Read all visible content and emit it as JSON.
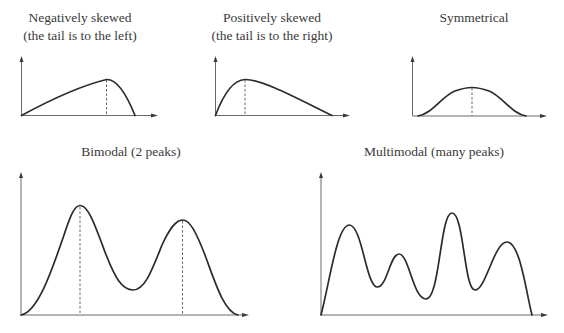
{
  "figure": {
    "panels": [
      {
        "id": "negatively-skewed",
        "title_lines": [
          "Negatively skewed",
          "(the tail is to the left)"
        ],
        "shape": "negative-skew",
        "mode_marked": true
      },
      {
        "id": "positively-skewed",
        "title_lines": [
          "Positively skewed",
          "(the tail is to the right)"
        ],
        "shape": "positive-skew",
        "mode_marked": true
      },
      {
        "id": "symmetrical",
        "title_lines": [
          "Symmetrical"
        ],
        "shape": "symmetric",
        "mode_marked": true
      },
      {
        "id": "bimodal",
        "title_lines": [
          "Bimodal (2 peaks)"
        ],
        "shape": "bimodal",
        "peaks": 2,
        "mode_marked": true
      },
      {
        "id": "multimodal",
        "title_lines": [
          "Multimodal (many peaks)"
        ],
        "shape": "multimodal",
        "peaks": 4,
        "mode_marked": false
      }
    ]
  }
}
